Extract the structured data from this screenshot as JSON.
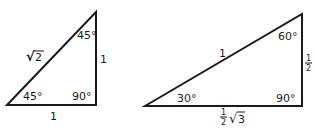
{
  "diagram": {
    "triangles": [
      {
        "id": "45-45-90",
        "angles": {
          "bottom_left": "45°",
          "top": "45°",
          "right_angle": "90°"
        },
        "sides": {
          "hypotenuse": "√2",
          "vertical": "1",
          "horizontal": "1"
        },
        "hypotenuse_radicand": "2",
        "hypotenuse_radical": "√"
      },
      {
        "id": "30-60-90",
        "angles": {
          "bottom_left": "30°",
          "top": "60°",
          "right_angle": "90°"
        },
        "sides": {
          "hypotenuse": "1",
          "vertical": "1/2",
          "horizontal": "1/2 √3"
        },
        "vertical_numerator": "1",
        "vertical_denominator": "2",
        "horizontal_numerator": "1",
        "horizontal_denominator": "2",
        "horizontal_radical": "√",
        "horizontal_radicand": "3"
      }
    ]
  }
}
